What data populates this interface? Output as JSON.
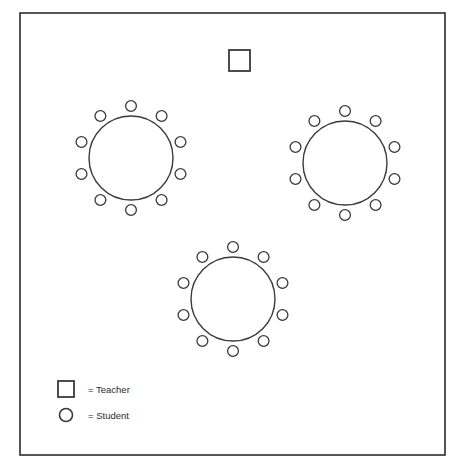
{
  "diagram": {
    "background_color": "#ffffff",
    "line_color": "#3a3a3a",
    "border_color": "#2b2b2b",
    "room": {
      "x": 20,
      "y": 13,
      "width": 425,
      "height": 442
    },
    "teacher": {
      "label": "Teacher",
      "x": 229,
      "y": 50,
      "size": 21
    },
    "tables": [
      {
        "name": "table-top-left",
        "cx": 131,
        "cy": 158,
        "r": 42,
        "seat_count": 10,
        "seat_r": 5.4,
        "seat_ring_r": 52,
        "start_angle": -90
      },
      {
        "name": "table-top-right",
        "cx": 345,
        "cy": 163,
        "r": 42,
        "seat_count": 10,
        "seat_r": 5.4,
        "seat_ring_r": 52,
        "start_angle": -90
      },
      {
        "name": "table-bottom-center",
        "cx": 233,
        "cy": 299,
        "r": 42,
        "seat_count": 10,
        "seat_r": 5.4,
        "seat_ring_r": 52,
        "start_angle": -90
      }
    ],
    "legend": {
      "entries": [
        {
          "key": "teacher",
          "symbol": "square",
          "label": "= Teacher",
          "symbol_x": 58,
          "symbol_y": 381,
          "symbol_size": 16,
          "text_x": 88,
          "text_y": 393
        },
        {
          "key": "student",
          "symbol": "circle",
          "label": "= Student",
          "symbol_cx": 66,
          "symbol_cy": 415,
          "symbol_r": 6.5,
          "text_x": 88,
          "text_y": 419
        }
      ]
    },
    "totals": {
      "students_per_table": 10,
      "table_count": 3,
      "total_students": 30,
      "teacher_count": 1
    }
  }
}
